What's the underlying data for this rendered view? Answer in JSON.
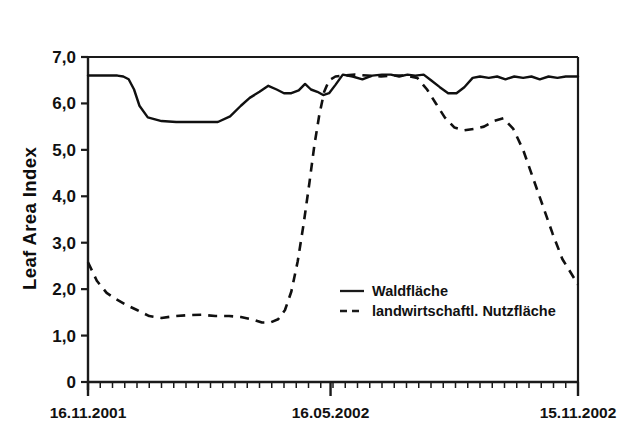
{
  "chart_data": {
    "type": "line",
    "title": "",
    "xlabel": "",
    "ylabel": "Leaf Area Index",
    "ylim": [
      0,
      7
    ],
    "yticks": [
      0,
      1,
      2,
      3,
      4,
      5,
      6,
      7
    ],
    "ytick_labels": [
      "0",
      "1,0",
      "2,0",
      "3,0",
      "4,0",
      "5,0",
      "6,0",
      "7,0"
    ],
    "xlim": [
      "16.11.2001",
      "15.11.2002"
    ],
    "xtick_labels": [
      "16.11.2001",
      "16.05.2002",
      "15.11.2002"
    ],
    "xtick_positions": [
      0.0,
      0.495,
      1.0
    ],
    "grid": false,
    "legend_position": "center-right-inside",
    "minor_xticks": 40,
    "series": [
      {
        "name": "Waldfläche",
        "style": "solid",
        "color": "#101010",
        "x": [
          0.0,
          0.022,
          0.044,
          0.06,
          0.072,
          0.083,
          0.094,
          0.105,
          0.122,
          0.15,
          0.18,
          0.21,
          0.24,
          0.265,
          0.29,
          0.312,
          0.33,
          0.35,
          0.368,
          0.385,
          0.4,
          0.415,
          0.43,
          0.443,
          0.455,
          0.468,
          0.48,
          0.492,
          0.505,
          0.52,
          0.54,
          0.56,
          0.58,
          0.6,
          0.618,
          0.635,
          0.652,
          0.668,
          0.685,
          0.7,
          0.718,
          0.735,
          0.752,
          0.768,
          0.785,
          0.8,
          0.818,
          0.835,
          0.852,
          0.87,
          0.888,
          0.905,
          0.922,
          0.94,
          0.958,
          0.975,
          1.0
        ],
        "values": [
          6.6,
          6.6,
          6.6,
          6.6,
          6.58,
          6.52,
          6.3,
          5.95,
          5.7,
          5.62,
          5.6,
          5.6,
          5.6,
          5.6,
          5.72,
          5.95,
          6.12,
          6.25,
          6.38,
          6.3,
          6.22,
          6.22,
          6.28,
          6.42,
          6.3,
          6.25,
          6.18,
          6.22,
          6.4,
          6.62,
          6.58,
          6.52,
          6.6,
          6.62,
          6.62,
          6.58,
          6.62,
          6.6,
          6.62,
          6.5,
          6.35,
          6.22,
          6.22,
          6.35,
          6.55,
          6.58,
          6.55,
          6.58,
          6.52,
          6.58,
          6.55,
          6.58,
          6.52,
          6.58,
          6.55,
          6.58,
          6.58
        ]
      },
      {
        "name": "landwirtschaftl. Nutzfläche",
        "style": "dashed",
        "color": "#101010",
        "x": [
          0.0,
          0.018,
          0.038,
          0.058,
          0.078,
          0.1,
          0.125,
          0.15,
          0.178,
          0.205,
          0.232,
          0.26,
          0.288,
          0.312,
          0.335,
          0.355,
          0.372,
          0.388,
          0.402,
          0.415,
          0.428,
          0.44,
          0.452,
          0.462,
          0.472,
          0.482,
          0.492,
          0.505,
          0.522,
          0.545,
          0.57,
          0.598,
          0.625,
          0.65,
          0.672,
          0.692,
          0.71,
          0.728,
          0.748,
          0.768,
          0.788,
          0.808,
          0.828,
          0.848,
          0.868,
          0.888,
          0.908,
          0.928,
          0.948,
          0.968,
          1.0
        ],
        "values": [
          2.58,
          2.18,
          1.92,
          1.78,
          1.66,
          1.55,
          1.42,
          1.38,
          1.42,
          1.44,
          1.45,
          1.42,
          1.42,
          1.4,
          1.35,
          1.28,
          1.28,
          1.35,
          1.55,
          1.95,
          2.6,
          3.4,
          4.3,
          5.1,
          5.75,
          6.25,
          6.5,
          6.58,
          6.6,
          6.62,
          6.6,
          6.58,
          6.6,
          6.6,
          6.55,
          6.3,
          6.0,
          5.7,
          5.48,
          5.42,
          5.45,
          5.5,
          5.62,
          5.68,
          5.45,
          5.0,
          4.4,
          3.8,
          3.2,
          2.65,
          2.1
        ]
      }
    ]
  },
  "axes": {
    "ylabel_title": "Leaf Area Index"
  },
  "legend": {
    "entries": [
      {
        "label": "Waldfläche",
        "style": "solid"
      },
      {
        "label": "landwirtschaftl. Nutzfläche",
        "style": "dashed"
      }
    ]
  }
}
